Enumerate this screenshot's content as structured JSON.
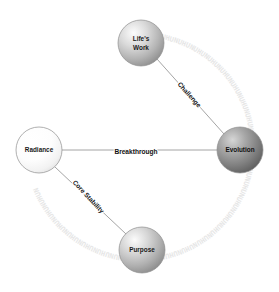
{
  "diagram": {
    "type": "node-link-network",
    "background_color": "#ffffff",
    "width": 279,
    "height": 292,
    "nodes": [
      {
        "id": "lifes-work",
        "label": "Life's Work",
        "label_lines": [
          "Life's",
          "Work"
        ],
        "cx": 141,
        "cy": 43,
        "r": 23,
        "fill_light": "#f2f2f2",
        "fill_mid": "#c9c9c9",
        "fill_dark": "#9e9e9e",
        "stroke": "#8e8e8e"
      },
      {
        "id": "evolution",
        "label": "Evolution",
        "label_lines": [
          "Evolution"
        ],
        "cx": 240,
        "cy": 150,
        "r": 23,
        "fill_light": "#d8d8d8",
        "fill_mid": "#a0a0a0",
        "fill_dark": "#6e6e6e",
        "stroke": "#676767"
      },
      {
        "id": "radiance",
        "label": "Radiance",
        "label_lines": [
          "Radiance"
        ],
        "cx": 39,
        "cy": 150,
        "r": 23,
        "fill_light": "#ffffff",
        "fill_mid": "#fbfbfb",
        "fill_dark": "#ececec",
        "stroke": "#c4c4c4"
      },
      {
        "id": "purpose",
        "label": "Purpose",
        "label_lines": [
          "Purpose"
        ],
        "cx": 142,
        "cy": 250,
        "r": 23,
        "fill_light": "#f0f0f0",
        "fill_mid": "#c5c5c5",
        "fill_dark": "#9b9b9b",
        "stroke": "#8e8e8e"
      }
    ],
    "edges": [
      {
        "id": "challenge",
        "label": "Challenge",
        "from": "lifes-work",
        "to": "evolution",
        "label_x": 189,
        "label_y": 95,
        "label_rotation": 48,
        "color": "#9a9a9a"
      },
      {
        "id": "breakthrough",
        "label": "Breakthrough",
        "from": "radiance",
        "to": "evolution",
        "label_x": 136,
        "label_y": 152,
        "label_rotation": 0,
        "color": "#9a9a9a"
      },
      {
        "id": "core-stability",
        "label": "Core Stability",
        "from": "radiance",
        "to": "purpose",
        "label_x": 88,
        "label_y": 197,
        "label_rotation": 47,
        "color": "#9a9a9a"
      }
    ],
    "decorative_ring": {
      "name": "faint-glyph-ring",
      "cx": 140,
      "cy": 147,
      "radius": 110,
      "glyph_text": "HUHUNUHUNUHUNUHUNUHUNUHUNUHUNUHUNUHUNUHUNUHUNUHUNUHUNUHUNUHUNUHUNUHUNUHUNUHUNUHUNUHUNUHUNUHUNUHUNUHUNUHUNUHUNUHUN",
      "color": "#e6e6e6"
    }
  }
}
